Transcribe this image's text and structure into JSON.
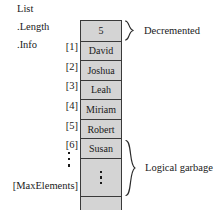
{
  "diagram": {
    "title": "List",
    "fields": {
      "name_label": "List",
      "length_label": ".Length",
      "info_label": ".Info"
    },
    "length_value": "5",
    "max_label": "[MaxElements]",
    "entries": [
      {
        "index": "[1]",
        "value": "David"
      },
      {
        "index": "[2]",
        "value": "Joshua"
      },
      {
        "index": "[3]",
        "value": "Leah"
      },
      {
        "index": "[4]",
        "value": "Miriam"
      },
      {
        "index": "[5]",
        "value": "Robert"
      },
      {
        "index": "[6]",
        "value": "Susan"
      }
    ],
    "annotations": {
      "decremented": "Decremented",
      "logical_garbage": "Logical garbage"
    },
    "colors": {
      "cell_fill": "#d4d4d4",
      "border": "#3a3a3a",
      "text": "#1a1a1a",
      "background": "#ffffff"
    }
  }
}
